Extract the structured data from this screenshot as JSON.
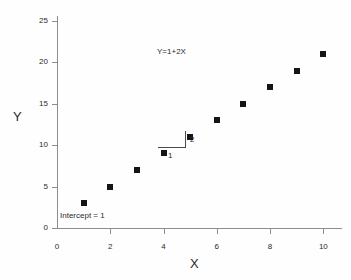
{
  "chart_data": {
    "type": "scatter",
    "title": "",
    "xlabel": "X",
    "ylabel": "Y",
    "xlim": [
      0,
      10.7
    ],
    "ylim": [
      0,
      25.6
    ],
    "grid": false,
    "legend": "none",
    "x": [
      1,
      2,
      3,
      4,
      5,
      6,
      7,
      8,
      9,
      10
    ],
    "values": [
      3,
      5,
      7,
      9,
      11,
      13,
      15,
      17,
      19,
      21
    ],
    "series": [
      {
        "name": "Y=1+2X",
        "points": [
          {
            "x": 1,
            "y": 3
          },
          {
            "x": 2,
            "y": 5
          },
          {
            "x": 3,
            "y": 7
          },
          {
            "x": 4,
            "y": 9
          },
          {
            "x": 5,
            "y": 11
          },
          {
            "x": 6,
            "y": 13
          },
          {
            "x": 7,
            "y": 15
          },
          {
            "x": 8,
            "y": 17
          },
          {
            "x": 9,
            "y": 19
          },
          {
            "x": 10,
            "y": 21
          }
        ]
      }
    ],
    "xticks": [
      0,
      2,
      4,
      6,
      8,
      10
    ],
    "yticks": [
      0,
      5,
      10,
      15,
      20,
      25
    ],
    "xtick_labels": [
      "0",
      "2",
      "4",
      "6",
      "8",
      "10"
    ],
    "ytick_labels": [
      "0",
      "5",
      "10",
      "15",
      "20",
      "25"
    ],
    "annotations": {
      "equation": "Y=1+2X",
      "intercept": "Intercept = 1",
      "run": "1",
      "rise": "2"
    },
    "colors": {
      "marker": "#151515",
      "axis": "#8d8d8d",
      "annotation_line": "#4a4a4a",
      "background": "#fefefe",
      "text": "#2b2b2b"
    }
  }
}
